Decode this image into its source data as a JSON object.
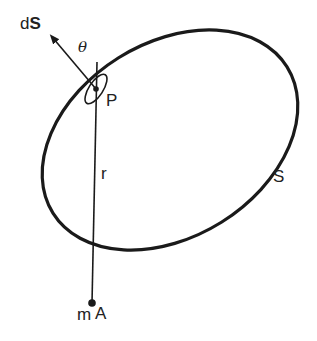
{
  "diagram": {
    "type": "gauss-law-surface",
    "stroke_color": "#1a1a1a",
    "labels": {
      "surface_element_prefix": "d",
      "surface_element_vector": "S",
      "angle": "θ",
      "point_p": "P",
      "distance": "r",
      "surface": "S",
      "mass": "m",
      "point_a": "A"
    }
  }
}
